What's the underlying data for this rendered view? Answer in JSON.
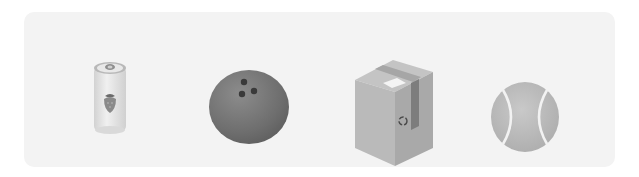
{
  "panel": {
    "background": "#f3f3f3",
    "items": [
      {
        "name": "soda-can",
        "label": "Can",
        "icon": "strawberry-soda-can-icon"
      },
      {
        "name": "bowling-ball",
        "label": "Bowling ball",
        "icon": "bowling-ball-icon"
      },
      {
        "name": "cardboard-box",
        "label": "Box",
        "icon": "cardboard-box-icon"
      },
      {
        "name": "tennis-ball",
        "label": "Tennis ball",
        "icon": "tennis-ball-icon"
      }
    ]
  },
  "colors": {
    "can_body": "#e6e6e6",
    "bowling_ball": "#767676",
    "box_face": "#b4b4b4",
    "tennis_ball": "#bdbdbd"
  }
}
